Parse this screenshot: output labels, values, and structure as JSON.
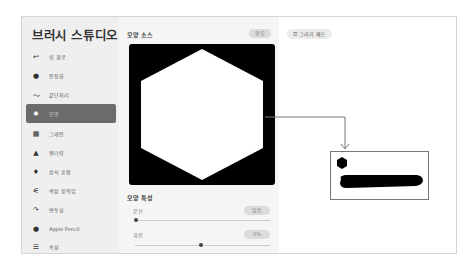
{
  "sidebar": {
    "title": "브러시 스튜디오",
    "items": [
      {
        "label": "획 경로",
        "icon": "stroke-path-icon",
        "glyph": "↩"
      },
      {
        "label": "안정화",
        "icon": "stabilization-icon",
        "glyph": "●"
      },
      {
        "label": "끝단처리",
        "icon": "taper-icon",
        "glyph": "〜"
      },
      {
        "label": "모양",
        "icon": "shape-icon",
        "glyph": "✹",
        "active": true
      },
      {
        "label": "그레인",
        "icon": "grain-icon",
        "glyph": "▦"
      },
      {
        "label": "렌더링",
        "icon": "rendering-icon",
        "glyph": "▲"
      },
      {
        "label": "습식 혼합",
        "icon": "wet-mix-icon",
        "glyph": "♦"
      },
      {
        "label": "색상 움직임",
        "icon": "color-dynamics-icon",
        "glyph": "⚟"
      },
      {
        "label": "변동성",
        "icon": "dynamics-icon",
        "glyph": "↷"
      },
      {
        "label": "Apple Pencil",
        "icon": "apple-pencil-icon",
        "glyph": "●"
      },
      {
        "label": "속성",
        "icon": "properties-icon",
        "glyph": "☰"
      }
    ]
  },
  "shape_source": {
    "title": "모양 소스",
    "edit_label": "편집"
  },
  "shape_properties": {
    "title": "모양 특성",
    "scatter": {
      "label": "분산",
      "value": "없음",
      "slider_pct": 0
    },
    "rotation": {
      "label": "회전",
      "value": "0%",
      "slider_pct": 50
    }
  },
  "drawing_pad": {
    "label": "그리기 패드",
    "icon": "edit-square-icon"
  },
  "colors": {
    "active_item": "#6b6b6b",
    "sidebar_bg": "#efefef",
    "preview_bg": "#000000"
  }
}
